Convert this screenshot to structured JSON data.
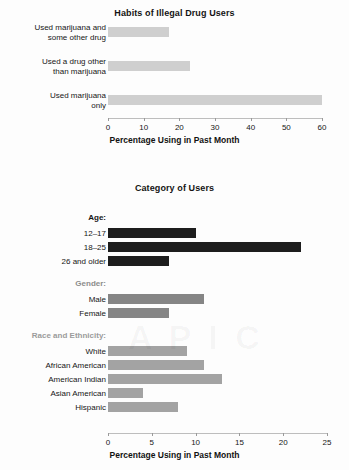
{
  "chart_data": [
    {
      "type": "bar",
      "orientation": "horizontal",
      "title": "Habits of Illegal Drug Users",
      "xlabel": "Percentage Using in Past Month",
      "ylabel": "",
      "xlim": [
        0,
        60
      ],
      "xticks": [
        0,
        10,
        20,
        30,
        40,
        50,
        60
      ],
      "grid": false,
      "legend": "none",
      "bar_color": "#cfcfcf",
      "categories": [
        "Used marijuana and some other drug",
        "Used a drug other than marijuana",
        "Used marijuana only"
      ],
      "values": [
        17,
        23,
        60
      ]
    },
    {
      "type": "bar",
      "orientation": "horizontal",
      "title": "Category of Users",
      "xlabel": "Percentage Using in Past Month",
      "ylabel": "",
      "xlim": [
        0,
        25
      ],
      "xticks": [
        0,
        5,
        10,
        15,
        20,
        25
      ],
      "grid": false,
      "legend": "none",
      "groups": [
        {
          "name": "Age:",
          "header_color": "#141414",
          "bar_color": "#1d1d1d",
          "categories": [
            "12–17",
            "18–25",
            "26 and older"
          ],
          "values": [
            10,
            22,
            7
          ]
        },
        {
          "name": "Gender:",
          "header_color": "#8c8c8c",
          "bar_color": "#858585",
          "categories": [
            "Male",
            "Female"
          ],
          "values": [
            11,
            7
          ]
        },
        {
          "name": "Race and Ethnicity:",
          "header_color": "#9b9b9b",
          "bar_color": "#a3a3a3",
          "categories": [
            "White",
            "African American",
            "American Indian",
            "Asian American",
            "Hispanic"
          ],
          "values": [
            9,
            11,
            13,
            4,
            8
          ]
        }
      ]
    }
  ],
  "chart_top": {
    "title": "Habits of Illegal Drug Users",
    "axis_title": "Percentage Using in Past Month",
    "ticks": [
      "0",
      "10",
      "20",
      "30",
      "40",
      "50",
      "60"
    ],
    "rows": [
      {
        "label_line1": "Used marijuana and",
        "label_line2": "some other drug",
        "value": 17
      },
      {
        "label_line1": "Used a drug other",
        "label_line2": "than marijuana",
        "value": 23
      },
      {
        "label_line1": "Used marijuana",
        "label_line2": "only",
        "value": 60
      }
    ]
  },
  "chart_bottom": {
    "title": "Category of Users",
    "axis_title": "Percentage Using in Past Month",
    "ticks": [
      "0",
      "5",
      "10",
      "15",
      "20",
      "25"
    ],
    "group_age": "Age:",
    "group_gender": "Gender:",
    "group_race": "Race and Ethnicity:",
    "rows": [
      {
        "label": "12–17",
        "value": 10
      },
      {
        "label": "18–25",
        "value": 22
      },
      {
        "label": "26 and older",
        "value": 7
      },
      {
        "label": "Male",
        "value": 11
      },
      {
        "label": "Female",
        "value": 7
      },
      {
        "label": "White",
        "value": 9
      },
      {
        "label": "African American",
        "value": 11
      },
      {
        "label": "American Indian",
        "value": 13
      },
      {
        "label": "Asian American",
        "value": 4
      },
      {
        "label": "Hispanic",
        "value": 8
      }
    ]
  }
}
